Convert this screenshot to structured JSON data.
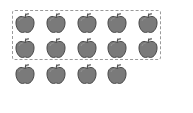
{
  "figure": {
    "apple_color": "#7a7a7a",
    "apple_outline": "#4a4a4a",
    "box_border_color": "#9a9a9a",
    "grouped": {
      "rows": 2,
      "per_row": 5,
      "count": 10
    },
    "ungrouped": {
      "rows": 1,
      "count": 4
    },
    "total_apples": 14,
    "apples": [
      {
        "x": 14,
        "y": 12,
        "group": "boxed"
      },
      {
        "x": 45,
        "y": 12,
        "group": "boxed"
      },
      {
        "x": 76,
        "y": 12,
        "group": "boxed"
      },
      {
        "x": 106,
        "y": 12,
        "group": "boxed"
      },
      {
        "x": 137,
        "y": 12,
        "group": "boxed"
      },
      {
        "x": 14,
        "y": 37,
        "group": "boxed"
      },
      {
        "x": 45,
        "y": 37,
        "group": "boxed"
      },
      {
        "x": 76,
        "y": 37,
        "group": "boxed"
      },
      {
        "x": 106,
        "y": 37,
        "group": "boxed"
      },
      {
        "x": 137,
        "y": 37,
        "group": "boxed"
      },
      {
        "x": 14,
        "y": 63,
        "group": "loose"
      },
      {
        "x": 45,
        "y": 63,
        "group": "loose"
      },
      {
        "x": 76,
        "y": 63,
        "group": "loose"
      },
      {
        "x": 106,
        "y": 63,
        "group": "loose"
      }
    ]
  }
}
